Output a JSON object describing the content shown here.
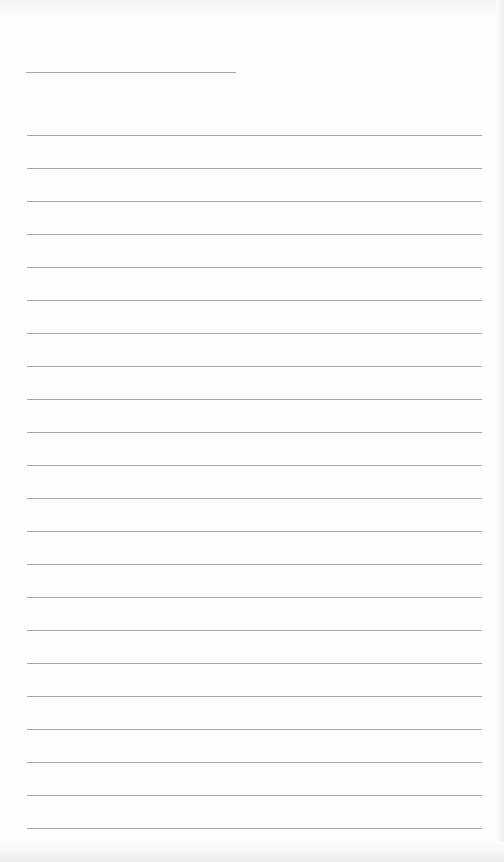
{
  "document": {
    "type": "lined-page",
    "header_line_count": 1,
    "body_line_count": 22,
    "text": ""
  }
}
